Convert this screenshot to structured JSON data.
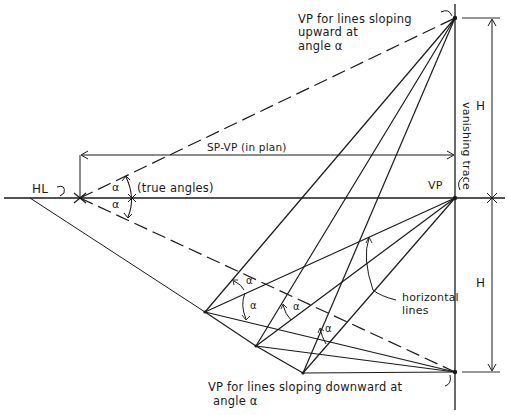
{
  "labels": {
    "vp_upward": [
      "VP for lines sloping",
      "upward at",
      "angle α"
    ],
    "vp_downward": [
      "VP for lines sloping downward at",
      "angle α"
    ],
    "vp": "VP",
    "hl": "HL",
    "sp_vp": "SP-VP  (in plan)",
    "true_angles": "(true angles)",
    "alpha": "α",
    "vanishing_trace": "vanishing trace",
    "horizontal_lines": [
      "horizontal",
      "lines"
    ],
    "h_upper": "H",
    "h_lower": "H"
  },
  "colors": {
    "ink": "#1a1a1a",
    "background": "#ffffff"
  }
}
